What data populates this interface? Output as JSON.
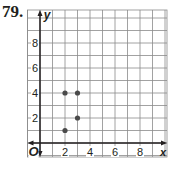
{
  "problem": {
    "number": "79."
  },
  "chart_data": {
    "type": "scatter",
    "title": "",
    "xlabel": "x",
    "ylabel": "y",
    "origin_label": "O",
    "x_ticks": [
      2,
      4,
      6,
      8
    ],
    "y_ticks": [
      2,
      4,
      6,
      8
    ],
    "xlim": [
      -1,
      10
    ],
    "ylim": [
      -1,
      10.6
    ],
    "grid": true,
    "points": [
      {
        "x": 2,
        "y": 4
      },
      {
        "x": 3,
        "y": 4
      },
      {
        "x": 3,
        "y": 2
      },
      {
        "x": 2,
        "y": 1
      }
    ],
    "colors": {
      "grid": "#8a8a8a",
      "axis": "#231f20",
      "point": "#4a4a4a"
    }
  }
}
